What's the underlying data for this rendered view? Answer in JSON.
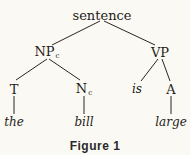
{
  "diagram": {
    "type": "syntax-tree",
    "nodes": {
      "root": {
        "label": "sentence",
        "x": 102,
        "y": 15
      },
      "np": {
        "label": "NP",
        "sub": "c",
        "x": 47,
        "y": 52
      },
      "vp": {
        "label": "VP",
        "x": 160,
        "y": 52
      },
      "t": {
        "label": "T",
        "x": 14,
        "y": 89
      },
      "n": {
        "label": "N",
        "sub": "c",
        "x": 84,
        "y": 89
      },
      "is": {
        "label": "is",
        "x": 137,
        "y": 89
      },
      "a": {
        "label": "A",
        "x": 171,
        "y": 89
      },
      "the": {
        "label": "the",
        "x": 14,
        "y": 122
      },
      "bill": {
        "label": "bill",
        "x": 84,
        "y": 122
      },
      "large": {
        "label": "large",
        "x": 171,
        "y": 122
      }
    },
    "edges": [
      [
        "sentence",
        "NPc"
      ],
      [
        "sentence",
        "VP"
      ],
      [
        "NPc",
        "T"
      ],
      [
        "NPc",
        "Nc"
      ],
      [
        "VP",
        "is"
      ],
      [
        "VP",
        "A"
      ],
      [
        "T",
        "the"
      ],
      [
        "Nc",
        "bill"
      ],
      [
        "A",
        "large"
      ]
    ],
    "caption": "Figure 1"
  }
}
